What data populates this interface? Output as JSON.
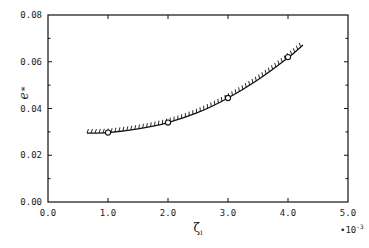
{
  "chart_data": {
    "type": "line",
    "title": "",
    "xlabel": "ζ_i",
    "ylabel": "e_*",
    "x_multiplier": "×10⁻³",
    "xlim": [
      0.0,
      5.0
    ],
    "ylim": [
      0.0,
      0.08
    ],
    "x_ticks": [
      "0.0",
      "1.0",
      "2.0",
      "3.0",
      "4.0",
      "5.0"
    ],
    "y_ticks": [
      "0.00",
      "0.02",
      "0.04",
      "0.06",
      "0.08"
    ],
    "grid": false,
    "legend": null,
    "series": [
      {
        "name": "curve (hatched boundary)",
        "style": "solid line with hatch marks",
        "x": [
          0.65,
          1.0,
          1.5,
          2.0,
          2.5,
          3.0,
          3.5,
          4.0,
          4.25
        ],
        "y": [
          0.0295,
          0.0297,
          0.0313,
          0.034,
          0.0383,
          0.0445,
          0.0523,
          0.0617,
          0.0672
        ]
      },
      {
        "name": "data points",
        "style": "open circles",
        "x": [
          1.0,
          2.0,
          3.0,
          4.0
        ],
        "y": [
          0.0297,
          0.034,
          0.0445,
          0.062
        ]
      }
    ]
  }
}
